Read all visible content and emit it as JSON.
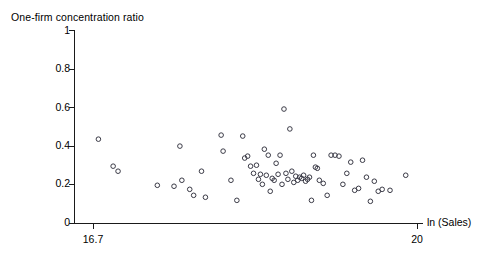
{
  "chart_data": {
    "type": "scatter",
    "title": "One-firm concentration ratio",
    "xlabel": "ln (Sales)",
    "ylabel": "One-firm concentration ratio",
    "xlim": [
      16.7,
      20.0
    ],
    "ylim": [
      0,
      1
    ],
    "grid": false,
    "legend": null,
    "xticks": [
      16.7,
      20
    ],
    "xtick_labels": [
      "16.7",
      "20"
    ],
    "yticks": [
      0,
      0.2,
      0.4,
      0.6,
      0.8,
      1
    ],
    "ytick_labels": [
      "0",
      "0.2",
      "0.4",
      "0.6",
      "0.8",
      "1"
    ],
    "marker": "open-circle",
    "marker_color": "#3a3a46",
    "n_points": 71,
    "points": [
      {
        "x": 16.75,
        "y": 0.437
      },
      {
        "x": 16.9,
        "y": 0.297
      },
      {
        "x": 16.95,
        "y": 0.271
      },
      {
        "x": 17.35,
        "y": 0.198
      },
      {
        "x": 17.58,
        "y": 0.401
      },
      {
        "x": 17.6,
        "y": 0.224
      },
      {
        "x": 17.68,
        "y": 0.177
      },
      {
        "x": 17.72,
        "y": 0.146
      },
      {
        "x": 17.8,
        "y": 0.271
      },
      {
        "x": 17.84,
        "y": 0.136
      },
      {
        "x": 18.0,
        "y": 0.458
      },
      {
        "x": 18.02,
        "y": 0.375
      },
      {
        "x": 18.1,
        "y": 0.224
      },
      {
        "x": 18.16,
        "y": 0.12
      },
      {
        "x": 18.24,
        "y": 0.339
      },
      {
        "x": 18.27,
        "y": 0.349
      },
      {
        "x": 18.3,
        "y": 0.297
      },
      {
        "x": 18.33,
        "y": 0.26
      },
      {
        "x": 18.36,
        "y": 0.302
      },
      {
        "x": 18.38,
        "y": 0.229
      },
      {
        "x": 18.4,
        "y": 0.255
      },
      {
        "x": 18.42,
        "y": 0.203
      },
      {
        "x": 18.44,
        "y": 0.385
      },
      {
        "x": 18.46,
        "y": 0.25
      },
      {
        "x": 18.48,
        "y": 0.354
      },
      {
        "x": 18.5,
        "y": 0.167
      },
      {
        "x": 18.52,
        "y": 0.234
      },
      {
        "x": 18.54,
        "y": 0.224
      },
      {
        "x": 18.56,
        "y": 0.312
      },
      {
        "x": 18.58,
        "y": 0.255
      },
      {
        "x": 18.6,
        "y": 0.354
      },
      {
        "x": 18.62,
        "y": 0.203
      },
      {
        "x": 18.64,
        "y": 0.593
      },
      {
        "x": 18.66,
        "y": 0.26
      },
      {
        "x": 18.68,
        "y": 0.229
      },
      {
        "x": 18.7,
        "y": 0.49
      },
      {
        "x": 18.72,
        "y": 0.271
      },
      {
        "x": 18.74,
        "y": 0.213
      },
      {
        "x": 18.76,
        "y": 0.245
      },
      {
        "x": 18.78,
        "y": 0.224
      },
      {
        "x": 18.8,
        "y": 0.24
      },
      {
        "x": 18.82,
        "y": 0.234
      },
      {
        "x": 18.84,
        "y": 0.25
      },
      {
        "x": 18.86,
        "y": 0.219
      },
      {
        "x": 18.88,
        "y": 0.229
      },
      {
        "x": 18.9,
        "y": 0.24
      },
      {
        "x": 18.92,
        "y": 0.12
      },
      {
        "x": 18.94,
        "y": 0.354
      },
      {
        "x": 18.96,
        "y": 0.292
      },
      {
        "x": 18.98,
        "y": 0.286
      },
      {
        "x": 19.0,
        "y": 0.224
      },
      {
        "x": 19.04,
        "y": 0.208
      },
      {
        "x": 19.08,
        "y": 0.146
      },
      {
        "x": 19.12,
        "y": 0.354
      },
      {
        "x": 19.16,
        "y": 0.354
      },
      {
        "x": 19.2,
        "y": 0.349
      },
      {
        "x": 19.24,
        "y": 0.203
      },
      {
        "x": 19.28,
        "y": 0.26
      },
      {
        "x": 19.32,
        "y": 0.318
      },
      {
        "x": 19.36,
        "y": 0.172
      },
      {
        "x": 19.4,
        "y": 0.182
      },
      {
        "x": 19.44,
        "y": 0.328
      },
      {
        "x": 19.48,
        "y": 0.24
      },
      {
        "x": 19.52,
        "y": 0.115
      },
      {
        "x": 19.56,
        "y": 0.219
      },
      {
        "x": 19.6,
        "y": 0.167
      },
      {
        "x": 19.64,
        "y": 0.177
      },
      {
        "x": 19.72,
        "y": 0.172
      },
      {
        "x": 19.88,
        "y": 0.25
      },
      {
        "x": 18.22,
        "y": 0.453
      },
      {
        "x": 17.52,
        "y": 0.193
      }
    ]
  },
  "axes": {
    "title": "One-firm concentration ratio",
    "xaxis_label": "ln (Sales)",
    "ytick_labels": [
      "1",
      "0.8",
      "0.6",
      "0.4",
      "0.2",
      "0"
    ],
    "xtick_labels": [
      "16.7",
      "20"
    ]
  }
}
